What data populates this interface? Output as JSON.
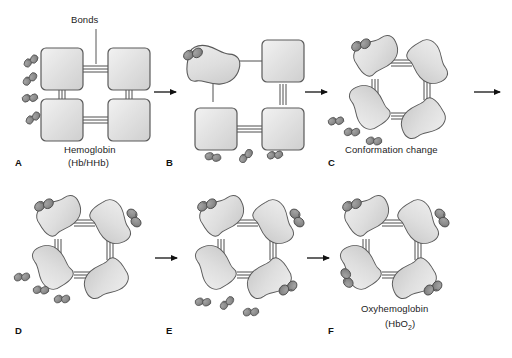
{
  "figure": {
    "background": "#ffffff",
    "colors": {
      "subunit_fill_light": "#e8e8e8",
      "subunit_fill_mid": "#d4d4d4",
      "subunit_stroke": "#5a5a5a",
      "oxygen_fill": "#8a8a8a",
      "oxygen_fill_dark": "#6e6e6e",
      "oxygen_stroke": "#4a4a4a",
      "bond_stroke": "#3a3a3a",
      "arrow_color": "#111111",
      "leader_color": "#444444",
      "text_color": "#1c1c1c"
    },
    "annotations": {
      "bonds_label": "Bonds"
    },
    "panels": [
      {
        "id": "A",
        "letter": "A",
        "caption_line1": "Hemoglobin",
        "caption_line2": "(Hb/HHb)",
        "state": "deoxyhemoglobin",
        "subunit_shape": "square",
        "bound_oxygen_count": 0,
        "free_oxygen_count": 4,
        "bond_style": "triple"
      },
      {
        "id": "B",
        "letter": "B",
        "caption_line1": "",
        "caption_line2": "",
        "state": "first oxygen bound",
        "subunit_shape": "mixed",
        "bound_oxygen_count": 1,
        "free_oxygen_count": 3,
        "bond_style": "mixed"
      },
      {
        "id": "C",
        "letter": "C",
        "caption_line1": "Conformation change",
        "caption_line2": "",
        "state": "conformation change",
        "subunit_shape": "kidney",
        "bound_oxygen_count": 1,
        "free_oxygen_count": 3,
        "bond_style": "triple"
      },
      {
        "id": "D",
        "letter": "D",
        "caption_line1": "",
        "caption_line2": "",
        "state": "two oxygen bound",
        "subunit_shape": "kidney",
        "bound_oxygen_count": 2,
        "free_oxygen_count": 3,
        "bond_style": "triple"
      },
      {
        "id": "E",
        "letter": "E",
        "caption_line1": "",
        "caption_line2": "",
        "state": "three oxygen bound",
        "subunit_shape": "kidney",
        "bound_oxygen_count": 3,
        "free_oxygen_count": 3,
        "bond_style": "triple"
      },
      {
        "id": "F",
        "letter": "F",
        "caption_line1": "Oxyhemoglobin",
        "caption_line2_prefix": "(HbO",
        "caption_line2_sub": "2",
        "caption_line2_suffix": ")",
        "state": "oxyhemoglobin fully saturated",
        "subunit_shape": "kidney",
        "bound_oxygen_count": 4,
        "free_oxygen_count": 0,
        "bond_style": "triple"
      }
    ],
    "arrows": [
      {
        "id": "arrow-a-b",
        "from": "A",
        "to": "B"
      },
      {
        "id": "arrow-b-c",
        "from": "B",
        "to": "C"
      },
      {
        "id": "arrow-c-wrap",
        "from": "C",
        "to": "D"
      },
      {
        "id": "arrow-d-e",
        "from": "D",
        "to": "E"
      },
      {
        "id": "arrow-e-f",
        "from": "E",
        "to": "F"
      }
    ]
  }
}
